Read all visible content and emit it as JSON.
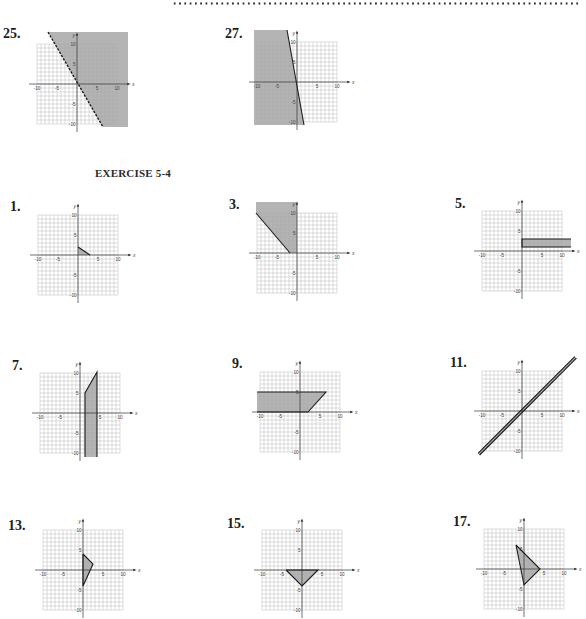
{
  "page": {
    "section_title": "EXERCISE 5-4"
  },
  "colors": {
    "shade": "#b4b4b4",
    "grid": "#a9a9a9",
    "axis": "#333333",
    "boundary": "#1c1c1c",
    "tick_text": "#444444"
  },
  "graph_axes": {
    "unit_px": 4,
    "grid_min": -10,
    "grid_max": 10,
    "x_axis_range": [
      -12,
      13
    ],
    "y_axis_range": [
      -12,
      12.5
    ],
    "x_label": "x",
    "y_label": "y",
    "x_ticks": [
      {
        "v": -10,
        "t": "-10"
      },
      {
        "v": -5,
        "t": "-5"
      },
      {
        "v": 5,
        "t": "5"
      },
      {
        "v": 10,
        "t": "10"
      }
    ],
    "y_ticks": [
      {
        "v": 10,
        "t": "10"
      },
      {
        "v": 5,
        "t": "5"
      },
      {
        "v": -5,
        "t": "-5"
      },
      {
        "v": -10,
        "t": "-10"
      }
    ]
  },
  "chart_data": [
    {
      "id": "25",
      "label": "25.",
      "type": "area",
      "xlim": [
        -10,
        10
      ],
      "ylim": [
        -10,
        10
      ],
      "regions": [
        [
          [
            -7.25,
            13
          ],
          [
            12.75,
            13
          ],
          [
            12.75,
            -10.75
          ],
          [
            6.5,
            -10.75
          ]
        ]
      ],
      "boundaries": [
        {
          "pts": [
            [
              -7.25,
              13
            ],
            [
              6.5,
              -10.75
            ]
          ],
          "style": "dashed"
        }
      ]
    },
    {
      "id": "27",
      "label": "27.",
      "type": "area",
      "xlim": [
        -10,
        10
      ],
      "ylim": [
        -10,
        10
      ],
      "regions": [
        [
          [
            -10.75,
            13
          ],
          [
            -2.5,
            13
          ],
          [
            1.75,
            -10.75
          ],
          [
            -10.75,
            -10.75
          ]
        ]
      ],
      "boundaries": [
        {
          "pts": [
            [
              -2.5,
              13
            ],
            [
              1.75,
              -10.75
            ]
          ],
          "style": "solid"
        }
      ]
    },
    {
      "id": "1",
      "label": "1.",
      "type": "area",
      "xlim": [
        -10,
        10
      ],
      "ylim": [
        -10,
        10
      ],
      "regions": [
        [
          [
            0,
            0
          ],
          [
            0,
            2
          ],
          [
            3,
            0
          ]
        ]
      ],
      "boundaries": [
        {
          "pts": [
            [
              0,
              2
            ],
            [
              3,
              0
            ]
          ],
          "style": "solid"
        }
      ]
    },
    {
      "id": "3",
      "label": "3.",
      "type": "area",
      "xlim": [
        -10,
        10
      ],
      "ylim": [
        -10,
        10
      ],
      "regions": [
        [
          [
            -10.25,
            12.75
          ],
          [
            0,
            12.75
          ],
          [
            0,
            0
          ],
          [
            -1.75,
            0
          ],
          [
            -10.25,
            10
          ]
        ]
      ],
      "boundaries": [
        {
          "pts": [
            [
              -10.25,
              10
            ],
            [
              -1.75,
              0
            ]
          ],
          "style": "solid"
        }
      ]
    },
    {
      "id": "5",
      "label": "5.",
      "type": "area",
      "xlim": [
        -10,
        10
      ],
      "ylim": [
        -10,
        10
      ],
      "regions": [
        [
          [
            0,
            1
          ],
          [
            0,
            3
          ],
          [
            12.25,
            3
          ],
          [
            12.25,
            1
          ]
        ]
      ],
      "boundaries": [
        {
          "pts": [
            [
              12.25,
              3
            ],
            [
              0,
              3
            ],
            [
              0,
              1
            ],
            [
              12.25,
              1
            ]
          ],
          "style": "solid"
        }
      ]
    },
    {
      "id": "7",
      "label": "7.",
      "type": "area",
      "xlim": [
        -10,
        10
      ],
      "ylim": [
        -10,
        10
      ],
      "regions": [
        [
          [
            1.25,
            -11
          ],
          [
            1.25,
            5
          ],
          [
            4.25,
            10.25
          ],
          [
            4.25,
            -11
          ]
        ]
      ],
      "boundaries": [
        {
          "pts": [
            [
              1.25,
              -11
            ],
            [
              1.25,
              5
            ],
            [
              4.25,
              10.25
            ],
            [
              4.25,
              -11
            ]
          ],
          "style": "solid"
        }
      ]
    },
    {
      "id": "9",
      "label": "9.",
      "type": "area",
      "xlim": [
        -10,
        10
      ],
      "ylim": [
        -10,
        10
      ],
      "regions": [
        [
          [
            -10.75,
            5
          ],
          [
            6.5,
            5
          ],
          [
            2,
            0
          ],
          [
            -10.75,
            0
          ]
        ]
      ],
      "boundaries": [
        {
          "pts": [
            [
              -10.75,
              5
            ],
            [
              6.5,
              5
            ],
            [
              2,
              0
            ],
            [
              -10.75,
              0
            ]
          ],
          "style": "solid"
        }
      ]
    },
    {
      "id": "11",
      "label": "11.",
      "type": "area",
      "xlim": [
        -10,
        10
      ],
      "ylim": [
        -10,
        10
      ],
      "regions": [
        [
          [
            -11,
            -10.6
          ],
          [
            13.2,
            13.6
          ],
          [
            13.6,
            13.2
          ],
          [
            -10.6,
            -11
          ]
        ]
      ],
      "boundaries": [
        {
          "pts": [
            [
              -11,
              -10.6
            ],
            [
              13.2,
              13.6
            ]
          ],
          "style": "solid"
        },
        {
          "pts": [
            [
              -10.6,
              -11
            ],
            [
              13.6,
              13.2
            ]
          ],
          "style": "solid"
        }
      ]
    },
    {
      "id": "13",
      "label": "13.",
      "type": "area",
      "xlim": [
        -10,
        10
      ],
      "ylim": [
        -10,
        10
      ],
      "regions": [
        [
          [
            0,
            4
          ],
          [
            2.5,
            1.5
          ],
          [
            0,
            -4
          ]
        ]
      ],
      "boundaries": [
        {
          "pts": [
            [
              0,
              4
            ],
            [
              2.5,
              1.5
            ],
            [
              0,
              -4
            ],
            [
              0,
              4
            ]
          ],
          "style": "solid"
        }
      ]
    },
    {
      "id": "15",
      "label": "15.",
      "type": "area",
      "xlim": [
        -10,
        10
      ],
      "ylim": [
        -10,
        10
      ],
      "regions": [
        [
          [
            -4,
            0
          ],
          [
            4,
            0
          ],
          [
            0,
            -4
          ]
        ]
      ],
      "boundaries": [
        {
          "pts": [
            [
              -4,
              0
            ],
            [
              4,
              0
            ],
            [
              0,
              -4
            ],
            [
              -4,
              0
            ]
          ],
          "style": "solid"
        }
      ]
    },
    {
      "id": "17",
      "label": "17.",
      "type": "area",
      "xlim": [
        -10,
        10
      ],
      "ylim": [
        -10,
        10
      ],
      "regions": [
        [
          [
            -2,
            6
          ],
          [
            4,
            0
          ],
          [
            0,
            -4
          ]
        ]
      ],
      "boundaries": [
        {
          "pts": [
            [
              -2,
              6
            ],
            [
              4,
              0
            ],
            [
              0,
              -4
            ],
            [
              -2,
              6
            ]
          ],
          "style": "solid"
        }
      ]
    }
  ]
}
